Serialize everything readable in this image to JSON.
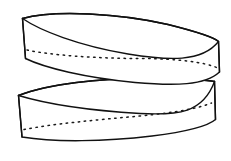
{
  "figure": {
    "title": "Two crossing elliptical bands",
    "style": "black ink line drawing on white background",
    "background_color": "#ffffff",
    "line_color": "#111111",
    "stitch_color": "#1a1a1a",
    "canvas": {
      "width": 231,
      "height": 161
    },
    "parts": [
      {
        "name": "upper-band",
        "label": "Upper band",
        "top_rim_path": "M 22.5 18.5 C 55 9.5, 120 13.5, 168 24.5 C 196 31.5, 214 37.5, 218.5 41.5",
        "near_rim_path": "M 22.5 18.5 C 40 30.5, 78 45.5, 128 54.0 C 168 60.5, 202 62.5, 218.5 41.5",
        "bottom_edge_path": "M 25.5 58.5 C 45 68.0, 85 77.5, 135 82.5 C 175 86.0, 205 85.5, 219.5 72.0",
        "left_edge_path": "M 22.5 18.5 L 25.5 58.5",
        "right_edge_path": "M 218.5 41.5 L 219.5 72.0",
        "stitch_path": "M 27.0 50.0 C 50 55.0, 95 58.5, 140 58.5 C 178 58.5, 205 62.5, 216.5 67.5",
        "stitch_dash": "1.5 4.6"
      },
      {
        "name": "lower-band",
        "label": "Lower band",
        "top_rim_path": "M 18.5 95.5 C 48 84.0, 100 78.0, 150 78.5 C 186 79.0, 208 80.0, 214.5 81.5",
        "near_rim_path": "M 18.5 95.5 C 45 103.5, 90 110.5, 140 113.5 C 178 115.5, 203 113.0, 214.5 81.5",
        "bottom_edge_path": "M 22.0 137.0 C 55 142.5, 105 141.5, 152 136.0 C 188 131.5, 208 126.0, 215.5 119.5",
        "left_edge_path": "M 18.5 95.5 L 22.0 137.0",
        "right_edge_path": "M 214.5 81.5 L 215.5 119.5",
        "stitch_path": "M 24.0 129.5 C 52 124.0, 95 120.0, 140 116.0 C 176 112.5, 200 108.0, 211.5 103.0",
        "stitch_dash": "1.5 4.6"
      }
    ]
  }
}
